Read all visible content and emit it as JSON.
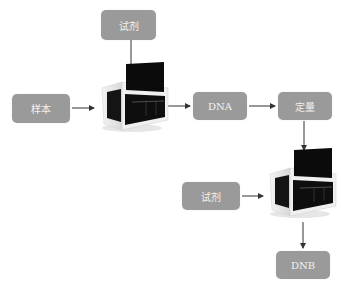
{
  "diagram": {
    "nodes": [
      {
        "id": "reagent-top",
        "label": "试剂"
      },
      {
        "id": "sample",
        "label": "样本"
      },
      {
        "id": "dna",
        "label": "DNA"
      },
      {
        "id": "quantify",
        "label": "定量"
      },
      {
        "id": "reagent-bottom",
        "label": "试剂"
      },
      {
        "id": "dnb",
        "label": "DNB"
      }
    ],
    "instruments": [
      {
        "id": "instrument-1",
        "icon": "lab-instrument-icon"
      },
      {
        "id": "instrument-2",
        "icon": "lab-instrument-icon"
      }
    ],
    "edges": [
      {
        "from": "reagent-top",
        "to": "instrument-1"
      },
      {
        "from": "sample",
        "to": "instrument-1"
      },
      {
        "from": "instrument-1",
        "to": "dna"
      },
      {
        "from": "dna",
        "to": "quantify"
      },
      {
        "from": "quantify",
        "to": "instrument-2"
      },
      {
        "from": "reagent-bottom",
        "to": "instrument-2"
      },
      {
        "from": "instrument-2",
        "to": "dnb"
      }
    ],
    "colors": {
      "box": "#9a9a9a",
      "box_text": "#f2f2f2",
      "arrow": "#333333",
      "instrument_dark": "#111111"
    }
  }
}
